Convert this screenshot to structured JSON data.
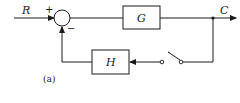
{
  "diagram": {
    "type": "block-diagram",
    "input_label": "R",
    "output_label": "C",
    "summing_junction": {
      "plus_sign": "+",
      "minus_sign": "−"
    },
    "forward_block": {
      "label": "G"
    },
    "feedback_block": {
      "label": "H"
    },
    "switch": {
      "state": "open"
    },
    "caption": "(a)",
    "colors": {
      "stroke": "#1a1a1a",
      "background": "#ffffff"
    }
  }
}
